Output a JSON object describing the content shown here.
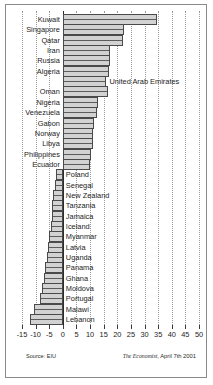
{
  "chart_data": {
    "type": "bar",
    "orientation": "horizontal",
    "title": "",
    "xlabel": "",
    "ylabel": "",
    "xlim": [
      -15,
      50
    ],
    "xticks": [
      -15,
      -10,
      -5,
      0,
      5,
      10,
      15,
      20,
      25,
      30,
      35,
      40,
      45,
      50
    ],
    "xtick_labels": [
      "-15",
      "-10",
      "-5",
      "0",
      "5",
      "10",
      "15",
      "20",
      "25",
      "30",
      "35",
      "40",
      "45",
      "50"
    ],
    "grid": true,
    "grid_style": "dotted-vertical",
    "legend": "none",
    "categories": [
      "Kuwait",
      "Singapore",
      "Qatar",
      "Iran",
      "Russia",
      "Algeria",
      "United Arab Emirates",
      "Oman",
      "Nigeria",
      "Venezuela",
      "Gabon",
      "Norway",
      "Libya",
      "Philippines",
      "Ecuador",
      "Poland",
      "Senegal",
      "New Zealand",
      "Tanzania",
      "Jamaica",
      "Iceland",
      "Myanmar",
      "Latvia",
      "Uganda",
      "Panama",
      "Ghana",
      "Moldova",
      "Portugal",
      "Malawi",
      "Lebanon"
    ],
    "values": [
      34.5,
      22.5,
      22.0,
      17.5,
      17.5,
      17.0,
      16.0,
      16.5,
      13.0,
      12.5,
      11.5,
      11.0,
      11.0,
      10.5,
      10.0,
      -2.5,
      -3.0,
      -3.5,
      -4.0,
      -4.0,
      -4.5,
      -5.0,
      -5.5,
      -6.0,
      -6.5,
      -7.0,
      -7.5,
      -8.5,
      -10.5,
      -12.0
    ]
  },
  "footer": {
    "source": "Source: EIU",
    "credit_brand": "The Economist",
    "credit_rest": ", April 7th 2001"
  },
  "colors": {
    "bar_fill": "#d2d2d2",
    "bar_stroke": "#4a4a4a",
    "grid": "#9a9a9a",
    "zero_axis": "#2b2b2b",
    "text": "#1c1c1c",
    "frame": "#8a8a8a",
    "background": "#ffffff"
  }
}
